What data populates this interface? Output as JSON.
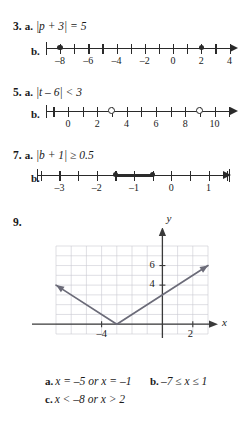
{
  "problems": [
    {
      "number": "3.",
      "part_a_label": "a.",
      "part_a_text": "|p + 3| = 5",
      "part_b_label": "b.",
      "numberline": {
        "min": -9,
        "max": 4.6,
        "labels": [
          {
            "value": -8,
            "text": "–8"
          },
          {
            "value": -6,
            "text": "–6"
          },
          {
            "value": -4,
            "text": "–4"
          },
          {
            "value": -2,
            "text": "–2"
          },
          {
            "value": 0,
            "text": "0"
          },
          {
            "value": 2,
            "text": "2"
          },
          {
            "value": 4,
            "text": "4"
          }
        ],
        "ticks": [
          -9,
          -8,
          -7,
          -6,
          -5,
          -4,
          -3,
          -2,
          -1,
          0,
          1,
          2,
          3,
          4
        ],
        "points": [
          {
            "value": -8,
            "type": "closed"
          },
          {
            "value": 2,
            "type": "closed"
          }
        ],
        "segments": [],
        "arrow_right": true,
        "arrow_left": false,
        "endcap_left": true
      }
    },
    {
      "number": "5.",
      "part_a_label": "a.",
      "part_a_text": "|t – 6| < 3",
      "part_b_label": "b.",
      "numberline": {
        "min": -1.5,
        "max": 11.6,
        "labels": [
          {
            "value": 0,
            "text": "0"
          },
          {
            "value": 2,
            "text": "2"
          },
          {
            "value": 4,
            "text": "4"
          },
          {
            "value": 6,
            "text": "6"
          },
          {
            "value": 8,
            "text": "8"
          },
          {
            "value": 10,
            "text": "10"
          }
        ],
        "ticks": [
          -1,
          0,
          1,
          2,
          3,
          4,
          5,
          6,
          7,
          8,
          9,
          10,
          11
        ],
        "points": [
          {
            "value": 3,
            "type": "open"
          },
          {
            "value": 9,
            "type": "open"
          }
        ],
        "segments": [],
        "arrow_right": true,
        "arrow_left": false,
        "endcap_left": true
      }
    },
    {
      "number": "7.",
      "part_a_label": "a.",
      "part_a_text": "|b + 1| ≥ 0.5",
      "part_b_label": "b.",
      "numberline": {
        "min": -3.6,
        "max": 1.6,
        "labels": [
          {
            "value": -3,
            "text": "–3"
          },
          {
            "value": -2,
            "text": "–2"
          },
          {
            "value": -1,
            "text": "–1"
          },
          {
            "value": 0,
            "text": "0"
          },
          {
            "value": 1,
            "text": "1"
          }
        ],
        "ticks": [
          -3.5,
          -3,
          -2.5,
          -2,
          -1.5,
          -1,
          -0.5,
          0,
          0.5,
          1,
          1.5
        ],
        "points": [
          {
            "value": -1.5,
            "type": "closed"
          },
          {
            "value": -0.5,
            "type": "closed"
          }
        ],
        "segments": [
          {
            "from": -1.5,
            "to": -0.5
          }
        ],
        "arrow_right": true,
        "arrow_left": false,
        "endcap_left": true,
        "endcap_right": true
      }
    },
    {
      "number": "9.",
      "graph": {
        "x_axis_label": "x",
        "y_axis_label": "y",
        "x_ticks": [
          {
            "value": -4,
            "text": "–4"
          },
          {
            "value": 2,
            "text": "2"
          }
        ],
        "y_ticks": [
          {
            "value": 4,
            "text": "4"
          },
          {
            "value": 6,
            "text": "6"
          }
        ],
        "xlim": [
          -7,
          3
        ],
        "ylim": [
          -1,
          8
        ],
        "vertex": {
          "x": -3,
          "y": 0
        },
        "slope": 1,
        "grid": true
      }
    }
  ],
  "answers": [
    {
      "label": "a.",
      "text": "x = –5 or x = –1"
    },
    {
      "label": "b.",
      "text": "–7 ≤ x ≤ 1"
    },
    {
      "label": "c.",
      "text": "x < –8   or   x > 2"
    }
  ]
}
